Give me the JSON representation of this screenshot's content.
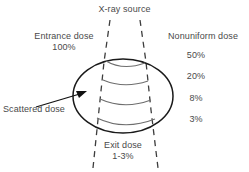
{
  "diagram": {
    "title_label": "X-ray source",
    "entrance": {
      "name": "Entrance dose",
      "value": "100%"
    },
    "nonuniform": {
      "name": "Nonuniform dose",
      "levels": [
        "50%",
        "20%",
        "8%",
        "3%"
      ]
    },
    "scattered_label": "Scattered dose",
    "exit": {
      "name": "Exit dose",
      "value": "1-3%"
    },
    "colors": {
      "background": "#ffffff",
      "text": "#4a4a4a",
      "body_outline": "#1a1a1a",
      "isodose_curve": "#6e6e6e",
      "beam_dashed": "#3d3d3d",
      "arrow": "#111111"
    }
  }
}
